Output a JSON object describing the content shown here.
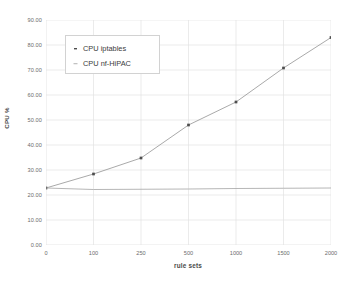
{
  "chart_data": {
    "type": "line",
    "title": "",
    "subtitle": "",
    "xlabel": "rule sets",
    "ylabel": "CPU %",
    "categories": [
      "0",
      "100",
      "250",
      "500",
      "1000",
      "1500",
      "2000"
    ],
    "ylim": [
      0,
      90
    ],
    "yticks": [
      "0.00",
      "10.00",
      "20.00",
      "30.00",
      "40.00",
      "50.00",
      "60.00",
      "70.00",
      "80.00",
      "90.00"
    ],
    "ytick_values": [
      0,
      10,
      20,
      30,
      40,
      50,
      60,
      70,
      80,
      90
    ],
    "grid": true,
    "legend_position": "upper-left-inside",
    "series": [
      {
        "name": "CPU iptables",
        "values": [
          22.8,
          28.4,
          34.8,
          48.0,
          57.2,
          70.8,
          83.0
        ],
        "color": "#9a9a9a",
        "marker": "square",
        "marker_color": "#4d4d4d"
      },
      {
        "name": "CPU nf-HiPAC",
        "values": [
          22.8,
          22.2,
          22.3,
          22.4,
          22.6,
          22.7,
          22.8
        ],
        "color": "#a9a9a9",
        "marker": "none",
        "marker_color": "#a9a9a9"
      }
    ]
  },
  "legend": {
    "items": [
      {
        "label": "CPU iptables",
        "marker_name": "legend-marker-iptables"
      },
      {
        "label": "CPU nf-HiPAC",
        "marker_name": "legend-marker-nfhipac"
      }
    ]
  },
  "colors": {
    "background": "#ffffff",
    "grid": "#e3e3e3",
    "axis_text": "#6c6c6c",
    "label_text": "#4a4a4a",
    "legend_border": "#d2d2d2",
    "series_iptables": "#9a9a9a",
    "series_nfhipac": "#a9a9a9",
    "marker": "#4d4d4d"
  }
}
